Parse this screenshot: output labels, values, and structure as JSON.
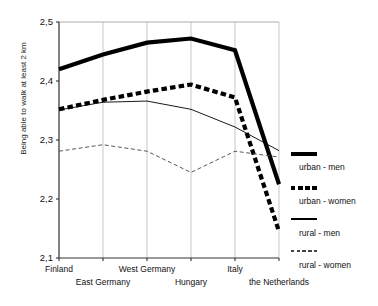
{
  "chart_data": {
    "type": "line",
    "title": "",
    "xlabel": "",
    "ylabel": "Being able to walk at least 2 km",
    "categories": [
      "Finland",
      "East Germany",
      "West Germany",
      "Hungary",
      "Italy",
      "the Netherlands"
    ],
    "ylim": [
      2.1,
      2.5
    ],
    "yticks": [
      "2,1",
      "2,2",
      "2,3",
      "2,4",
      "2,5"
    ],
    "ytick_values": [
      2.1,
      2.2,
      2.3,
      2.4,
      2.5
    ],
    "grid": "vertical",
    "legend_position": "right",
    "series": [
      {
        "name": "urban - men",
        "style": "thick-solid",
        "values": [
          2.42,
          2.445,
          2.465,
          2.472,
          2.452,
          2.225
        ]
      },
      {
        "name": "urban - women",
        "style": "thick-dashed",
        "values": [
          2.352,
          2.368,
          2.382,
          2.394,
          2.372,
          2.145
        ]
      },
      {
        "name": "rural - men",
        "style": "thin-solid",
        "values": [
          2.351,
          2.364,
          2.366,
          2.352,
          2.322,
          2.282
        ]
      },
      {
        "name": "rural - women",
        "style": "thin-dashed",
        "values": [
          2.281,
          2.292,
          2.281,
          2.245,
          2.281,
          2.271
        ]
      }
    ]
  },
  "legend": {
    "items": [
      {
        "label": "urban - men"
      },
      {
        "label": "urban - women"
      },
      {
        "label": "rural - men"
      },
      {
        "label": "rural - women"
      }
    ]
  },
  "axis": {
    "y_title": "Being able to walk at least 2 km"
  }
}
